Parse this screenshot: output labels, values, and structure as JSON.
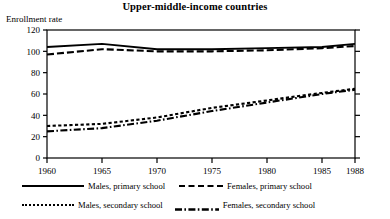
{
  "chart_data": {
    "type": "line",
    "title": "Upper-middle-income countries",
    "ylabel": "Enrollment rate",
    "xlabel": "",
    "xlim": [
      1960,
      1988
    ],
    "ylim": [
      0,
      120
    ],
    "yticks": [
      0,
      20,
      40,
      60,
      80,
      100,
      120
    ],
    "xticks": [
      1960,
      1965,
      1970,
      1975,
      1980,
      1985,
      1988
    ],
    "grid": false,
    "legend_position": "below",
    "x": [
      1960,
      1965,
      1970,
      1975,
      1980,
      1985,
      1988
    ],
    "series": [
      {
        "name": "Males, primary school",
        "style": "solid",
        "values": [
          104,
          107,
          102,
          102,
          103,
          104,
          107
        ]
      },
      {
        "name": "Females, primary school",
        "style": "dashed",
        "values": [
          97,
          102,
          100,
          100,
          101,
          103,
          105
        ]
      },
      {
        "name": "Males, secondary school",
        "style": "dotted",
        "values": [
          30,
          32,
          38,
          47,
          54,
          61,
          65
        ]
      },
      {
        "name": "Females, secondary school",
        "style": "dash-dot",
        "values": [
          25,
          28,
          35,
          44,
          52,
          60,
          64
        ]
      }
    ]
  },
  "legend": {
    "items": [
      "Males, primary school",
      "Females, primary school",
      "Males, secondary school",
      "Females, secondary school"
    ]
  },
  "axis": {
    "ytick_labels": [
      "120",
      "100",
      "80",
      "60",
      "40",
      "20",
      "0"
    ],
    "xtick_labels": [
      "1960",
      "1965",
      "1970",
      "1975",
      "1980",
      "1985",
      "1988"
    ]
  },
  "colors": {
    "ink": "#000000",
    "background": "#ffffff"
  }
}
